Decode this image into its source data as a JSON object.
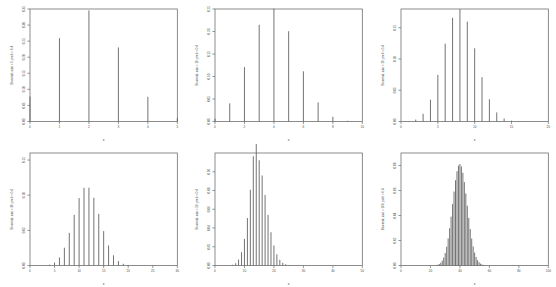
{
  "figure": {
    "type": "stem-plot-grid",
    "rows": 2,
    "cols": 3,
    "background": "#ffffff",
    "stem_color": "#5a5a5a",
    "frame_color": "#707070",
    "axis_color": "#6b6b6b"
  },
  "chart_data": [
    {
      "type": "bar",
      "panel_index": 0,
      "title": "",
      "xlabel": "x",
      "ylabel": "Binomial; size = 5; prob = 0.4",
      "size": 5,
      "prob": 0.4,
      "xlim": [
        0,
        5
      ],
      "ylim": [
        0,
        0.35
      ],
      "xticks": [
        0,
        1,
        2,
        3,
        4,
        5
      ],
      "xticklabels": [
        "0",
        "1",
        "2",
        "3",
        "4",
        "5"
      ],
      "yticks": [
        0.0,
        0.05,
        0.1,
        0.15,
        0.2,
        0.25,
        0.3,
        0.35
      ],
      "yticklabels": [
        "0.00",
        "0.05",
        "0.10",
        "0.15",
        "0.20",
        "0.25",
        "0.30",
        "0.35"
      ],
      "grid": false,
      "legend": false,
      "categories": [
        0,
        1,
        2,
        3,
        4,
        5
      ],
      "values": [
        0.07776,
        0.2592,
        0.3456,
        0.2304,
        0.0768,
        0.01024
      ]
    },
    {
      "type": "bar",
      "panel_index": 1,
      "title": "",
      "xlabel": "x",
      "ylabel": "Binomial; size = 10; prob = 0.4",
      "size": 10,
      "prob": 0.4,
      "xlim": [
        0,
        10
      ],
      "ylim": [
        0,
        0.25
      ],
      "xticks": [
        0,
        2,
        4,
        6,
        8,
        10
      ],
      "xticklabels": [
        "0",
        "2",
        "4",
        "6",
        "8",
        "10"
      ],
      "yticks": [
        0.0,
        0.05,
        0.1,
        0.15,
        0.2,
        0.25
      ],
      "yticklabels": [
        "0.00",
        "0.05",
        "0.10",
        "0.15",
        "0.20",
        "0.25"
      ],
      "grid": false,
      "legend": false,
      "categories": [
        0,
        1,
        2,
        3,
        4,
        5,
        6,
        7,
        8,
        9,
        10
      ],
      "values": [
        0.0060466,
        0.0403108,
        0.1209324,
        0.2149908,
        0.2508227,
        0.2006581,
        0.1114767,
        0.0424673,
        0.0106168,
        0.0015729,
        0.0001049
      ]
    },
    {
      "type": "bar",
      "panel_index": 2,
      "title": "",
      "xlabel": "x",
      "ylabel": "Binomial; size = 20; prob = 0.4",
      "size": 20,
      "prob": 0.4,
      "xlim": [
        0,
        20
      ],
      "ylim": [
        0,
        0.18
      ],
      "xticks": [
        0,
        5,
        10,
        15,
        20
      ],
      "xticklabels": [
        "0",
        "5",
        "10",
        "15",
        "20"
      ],
      "yticks": [
        0.0,
        0.05,
        0.1,
        0.15
      ],
      "yticklabels": [
        "0.00",
        "0.05",
        "0.10",
        "0.15"
      ],
      "grid": false,
      "legend": false,
      "categories": [
        0,
        1,
        2,
        3,
        4,
        5,
        6,
        7,
        8,
        9,
        10,
        11,
        12,
        13,
        14,
        15,
        16,
        17,
        18,
        19,
        20
      ],
      "values": [
        3.66e-05,
        0.0004875,
        0.0030903,
        0.0123611,
        0.0349895,
        0.0746442,
        0.124407,
        0.165876,
        0.1797323,
        0.1597621,
        0.1171055,
        0.070973,
        0.0354865,
        0.0145586,
        0.0048529,
        0.0012941,
        0.0002697,
        4.23e-05,
        4.7e-06,
        3e-07,
        0.0
      ]
    },
    {
      "type": "bar",
      "panel_index": 3,
      "title": "",
      "xlabel": "x",
      "ylabel": "Binomial; size = 30; prob = 0.4",
      "size": 30,
      "prob": 0.4,
      "xlim": [
        0,
        30
      ],
      "ylim": [
        0,
        0.16
      ],
      "xticks": [
        0,
        5,
        10,
        15,
        20,
        25,
        30
      ],
      "xticklabels": [
        "0",
        "5",
        "10",
        "15",
        "20",
        "25",
        "30"
      ],
      "yticks": [
        0.0,
        0.05,
        0.1,
        0.15
      ],
      "yticklabels": [
        "0.00",
        "0.05",
        "0.10",
        "0.15"
      ],
      "grid": false,
      "legend": false,
      "categories": [
        0,
        1,
        2,
        3,
        4,
        5,
        6,
        7,
        8,
        9,
        10,
        11,
        12,
        13,
        14,
        15,
        16,
        17,
        18,
        19,
        20,
        21,
        22,
        23,
        24,
        25,
        26,
        27,
        28,
        29,
        30
      ],
      "values": [
        2e-07,
        4.7e-06,
        4.57e-05,
        0.0002843,
        0.0012664,
        0.0042882,
        0.0115169,
        0.0252942,
        0.0463394,
        0.0720835,
        0.096,
        0.1105,
        0.1106,
        0.0963,
        0.0734,
        0.0489,
        0.0285,
        0.0145,
        0.0064,
        0.0025,
        0.0008,
        0.0002,
        0.0001,
        0.0,
        0.0,
        0.0,
        0.0,
        0.0,
        0.0,
        0.0,
        0.0
      ]
    },
    {
      "type": "bar",
      "panel_index": 4,
      "title": "",
      "xlabel": "x",
      "ylabel": "Binomial; size = 50; prob = 0.4",
      "size": 50,
      "prob": 0.4,
      "xlim": [
        0,
        50
      ],
      "ylim": [
        0,
        0.12
      ],
      "xticks": [
        0,
        10,
        20,
        30,
        40,
        50
      ],
      "xticklabels": [
        "0",
        "10",
        "20",
        "30",
        "40",
        "50"
      ],
      "yticks": [
        0.0,
        0.02,
        0.04,
        0.06,
        0.08,
        0.1
      ],
      "yticklabels": [
        "0.00",
        "0.02",
        "0.04",
        "0.06",
        "0.08",
        "0.10"
      ],
      "grid": false,
      "legend": false,
      "categories": [
        0,
        1,
        2,
        3,
        4,
        5,
        6,
        7,
        8,
        9,
        10,
        11,
        12,
        13,
        14,
        15,
        16,
        17,
        18,
        19,
        20,
        21,
        22,
        23,
        24,
        25,
        26,
        27,
        28,
        29,
        30,
        31,
        32,
        33,
        34,
        35,
        36,
        37,
        38,
        39,
        40,
        41,
        42,
        43,
        44,
        45,
        46,
        47,
        48,
        49,
        50
      ],
      "values": [
        0,
        0,
        0,
        0,
        0.0001,
        0.0002,
        0.0008,
        0.0024,
        0.0063,
        0.0142,
        0.0284,
        0.0506,
        0.0808,
        0.1165,
        0.1525,
        0.1123,
        0.096,
        0.0753,
        0.054,
        0.0355,
        0.0214,
        0.0119,
        0.0061,
        0.0029,
        0.0013,
        0.0005,
        0.0002,
        0.0001,
        0,
        0,
        0,
        0,
        0,
        0,
        0,
        0,
        0,
        0,
        0,
        0,
        0,
        0,
        0,
        0,
        0,
        0,
        0,
        0,
        0,
        0,
        0
      ]
    },
    {
      "type": "bar",
      "panel_index": 5,
      "title": "",
      "xlabel": "x",
      "ylabel": "Binomial; size = 100; prob = 0.4",
      "size": 100,
      "prob": 0.4,
      "xlim": [
        0,
        100
      ],
      "ylim": [
        0,
        0.09
      ],
      "xticks": [
        0,
        20,
        40,
        60,
        80,
        100
      ],
      "xticklabels": [
        "0",
        "20",
        "40",
        "60",
        "80",
        "100"
      ],
      "yticks": [
        0.0,
        0.02,
        0.04,
        0.06,
        0.08
      ],
      "yticklabels": [
        "0.00",
        "0.02",
        "0.04",
        "0.06",
        "0.08"
      ],
      "grid": false,
      "legend": false,
      "categories": [],
      "values": []
    }
  ]
}
